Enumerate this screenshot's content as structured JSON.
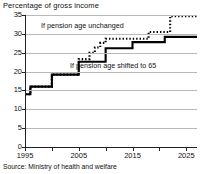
{
  "chart_data": {
    "type": "line",
    "title": "Percentage of gross income",
    "xlabel": "",
    "ylabel": "Percentage of gross income",
    "xlim": [
      1995,
      2027
    ],
    "ylim": [
      0,
      35
    ],
    "yticks": [
      0,
      5,
      10,
      15,
      20,
      25,
      30,
      35
    ],
    "xticks": [
      1995,
      2005,
      2015,
      2025
    ],
    "xtick_labels": [
      "1995",
      "2005",
      "2015",
      "2025"
    ],
    "ytick_labels": [
      "0",
      "5",
      "10",
      "15",
      "20",
      "25",
      "30",
      "35"
    ],
    "grid": true,
    "legend": "annotations-inline",
    "step_style": "post",
    "series": [
      {
        "name": "If pension age unchanged",
        "style": "dotted",
        "color": "#000000",
        "x": [
          1995,
          1996,
          1999,
          2000,
          2004,
          2005,
          2006,
          2007,
          2008,
          2009,
          2010,
          2011,
          2017,
          2018,
          2021,
          2022,
          2027
        ],
        "values": [
          14.0,
          16.0,
          16.0,
          19.2,
          19.2,
          23.3,
          23.3,
          25.0,
          26.4,
          27.6,
          28.7,
          28.7,
          28.7,
          30.5,
          30.5,
          34.7,
          34.7
        ]
      },
      {
        "name": "If pension age shifted to 65",
        "style": "solid",
        "color": "#000000",
        "x": [
          1995,
          1996,
          1999,
          2000,
          2004,
          2005,
          2009,
          2010,
          2014,
          2015,
          2020,
          2021,
          2027
        ],
        "values": [
          14.0,
          16.0,
          16.0,
          19.2,
          19.2,
          22.6,
          22.6,
          26.2,
          26.2,
          27.8,
          27.8,
          29.2,
          29.2
        ]
      }
    ],
    "annotations": [
      {
        "text": "If pension age unchanged",
        "x": 2001,
        "y": 31.6
      },
      {
        "text": "If pension age shifted to 65",
        "x": 2008,
        "y": 21.3
      }
    ]
  },
  "footer": {
    "source": "Source: Ministry of health and welfare"
  }
}
